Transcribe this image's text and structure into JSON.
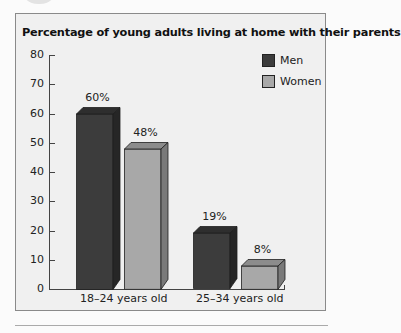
{
  "chart_data": {
    "type": "bar",
    "title": "Percentage of young adults living at home with their parents",
    "categories": [
      "18–24 years old",
      "25–34 years old"
    ],
    "series": [
      {
        "name": "Men",
        "values": [
          60,
          19
        ],
        "color": "#3c3c3c"
      },
      {
        "name": "Women",
        "values": [
          48,
          8
        ],
        "color": "#a8a8a8"
      }
    ],
    "value_labels": [
      [
        "60%",
        "19%"
      ],
      [
        "48%",
        "8%"
      ]
    ],
    "xlabel": "",
    "ylabel": "",
    "ylim": [
      0,
      80
    ],
    "yticks": [
      "0",
      "10",
      "20",
      "30",
      "40",
      "50",
      "60",
      "70",
      "80"
    ],
    "grid": false,
    "legend_position": "top-right",
    "style": "3d-bar"
  }
}
